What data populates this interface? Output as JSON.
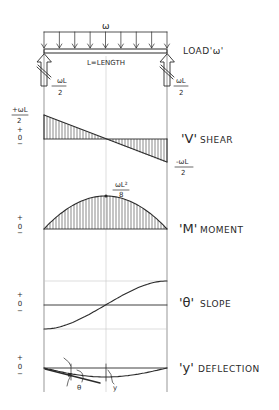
{
  "diagram": {
    "load": {
      "symbol": "ω",
      "label_quote": "LOAD'ω'",
      "beam_label": "L=LENGTH",
      "arrow_count": 9
    },
    "reactions": {
      "left": {
        "num": "ωL",
        "den": "2"
      },
      "right": {
        "num": "ωL",
        "den": "2"
      }
    },
    "shear": {
      "symbol": "'V'",
      "label": "SHEAR",
      "top_value": {
        "num": "+ωL",
        "den": "2"
      },
      "bottom_value": {
        "num": "-ωL",
        "den": "2"
      },
      "axis_signs": [
        "+",
        "0",
        "−"
      ],
      "values_normalized": {
        "start": 1,
        "mid": 0,
        "end": -1
      }
    },
    "moment": {
      "symbol": "'M'",
      "label": "MOMENT",
      "peak_value": {
        "num": "ωL²",
        "den": "8"
      },
      "axis_signs": [
        "+",
        "0",
        "−"
      ],
      "shape": "parabola",
      "peak_position": 0.5
    },
    "slope": {
      "symbol": "'θ'",
      "label": "SLOPE",
      "axis_signs": [
        "+",
        "0",
        "−"
      ],
      "shape": "cubic",
      "values_normalized": {
        "start": -1,
        "mid": 0,
        "end": 1
      }
    },
    "deflection": {
      "symbol": "'y'",
      "label": "DEFLECTION",
      "axis_signs": [
        "+",
        "0",
        "−"
      ],
      "angle_label": "θ",
      "sag_label": "y",
      "shape": "quartic"
    }
  }
}
